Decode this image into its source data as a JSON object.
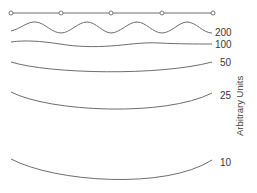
{
  "figure": {
    "axis_label": "Arbitrary Units",
    "reference_line": {
      "nodes_x": [
        11,
        61,
        111,
        162,
        213
      ],
      "y": 13
    },
    "curves": [
      {
        "label": "200",
        "shape": "wave-large"
      },
      {
        "label": "100",
        "shape": "wave-small"
      },
      {
        "label": "50",
        "shape": "arc-shallow"
      },
      {
        "label": "25",
        "shape": "arc-medium"
      },
      {
        "label": "10",
        "shape": "arc-deep"
      }
    ],
    "colors": {
      "stroke": "#6e6e6e",
      "text": "#3a3a3a",
      "background": "#ffffff"
    }
  }
}
